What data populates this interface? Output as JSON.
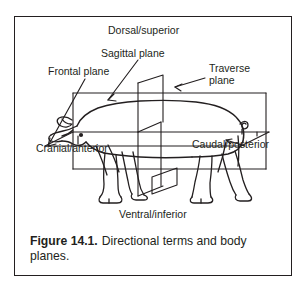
{
  "figure": {
    "frame": {
      "border_color": "#231f20",
      "background": "#ffffff"
    },
    "illustration": {
      "subject": "pig-lateral-view",
      "stroke_color": "#231f20",
      "description": "Line drawing of a pig in lateral view intersected by three anatomical planes drawn as a 3D box"
    },
    "labels": [
      {
        "id": "dorsal",
        "name": "dorsal-superior-label",
        "text": "Dorsal/superior"
      },
      {
        "id": "sagittal",
        "name": "sagittal-plane-label",
        "text": "Sagittal plane"
      },
      {
        "id": "frontal",
        "name": "frontal-plane-label",
        "text": "Frontal plane"
      },
      {
        "id": "traverse",
        "name": "traverse-plane-label",
        "line1": "Traverse",
        "line2": "plane"
      },
      {
        "id": "cranial",
        "name": "cranial-anterior-label",
        "text": "Cranial/anterior"
      },
      {
        "id": "caudal",
        "name": "caudal-posterior-label",
        "text": "Caudal/posterior"
      },
      {
        "id": "ventral",
        "name": "ventral-inferior-label",
        "text": "Ventral/inferior"
      }
    ],
    "caption": {
      "number": "Figure 14.1.",
      "text": "Directional terms and body planes."
    }
  }
}
